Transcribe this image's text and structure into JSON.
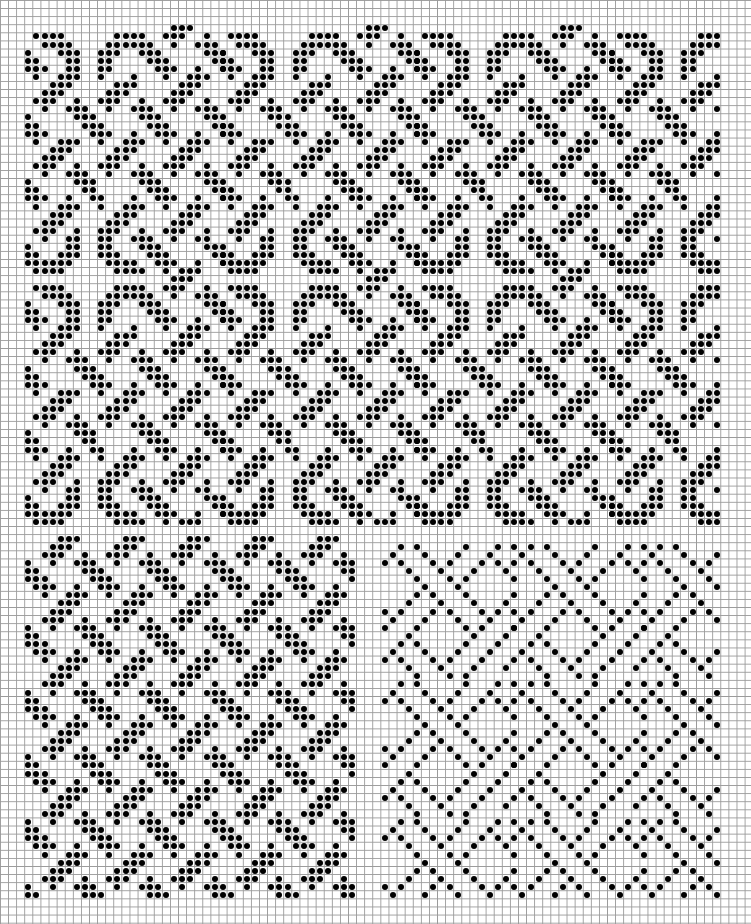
{
  "sheet": {
    "type": "dot pattern chart on grid paper",
    "cell_px": 8.1,
    "cols": 93,
    "rows": 114,
    "grid_color": "#9a9a9a",
    "dot_color": "#000000",
    "background": "#ffffff"
  },
  "panels": [
    {
      "name": "top-interlace-panel",
      "col_start": 3,
      "col_end": 88,
      "row_starts": [
        3,
        34
      ],
      "h_period": 24,
      "motif_col_origin": 3,
      "motif_rows": [
        [
          21,
          22,
          23
        ],
        [
          4,
          5,
          6,
          7,
          14,
          15,
          16,
          17,
          20,
          21,
          22,
          25
        ],
        [
          5,
          6,
          7,
          8,
          13,
          14,
          15,
          16,
          17,
          18,
          21,
          24,
          25,
          26
        ],
        [
          3,
          7,
          8,
          9,
          12,
          13,
          14,
          17,
          18,
          19,
          25,
          26,
          27
        ],
        [
          3,
          4,
          8,
          9,
          12,
          13,
          18,
          19,
          20,
          26,
          27
        ],
        [
          3,
          4,
          5,
          8,
          9,
          12,
          13,
          19,
          20,
          21,
          24,
          27
        ],
        [
          4,
          7,
          8,
          9,
          12,
          16,
          20,
          23,
          24,
          25
        ],
        [
          6,
          7,
          8,
          14,
          15,
          16,
          22,
          23,
          24
        ],
        [
          5,
          6,
          7,
          13,
          14,
          15,
          21,
          22,
          23
        ],
        [
          4,
          5,
          6,
          9,
          12,
          13,
          14,
          17,
          20,
          21,
          22,
          25
        ],
        [
          5,
          8,
          9,
          10,
          13,
          16,
          17,
          18,
          21,
          24,
          25,
          26
        ],
        [
          3,
          9,
          10,
          11,
          17,
          18,
          19,
          25,
          26
        ],
        [
          3,
          4,
          10,
          11,
          12,
          18,
          19,
          20,
          26,
          27
        ],
        [
          3,
          4,
          5,
          11,
          12,
          13,
          16,
          19,
          20,
          21,
          24,
          27
        ],
        [
          4,
          7,
          8,
          9,
          12,
          15,
          16,
          17,
          20,
          23,
          24,
          25
        ],
        [
          6,
          7,
          8,
          14,
          15,
          16,
          22,
          23,
          24
        ],
        [
          5,
          6,
          7,
          13,
          14,
          15,
          21,
          22,
          23
        ],
        [
          4,
          5,
          6,
          9,
          12,
          13,
          14,
          17,
          20,
          21,
          22,
          25
        ],
        [
          5,
          8,
          9,
          10,
          13,
          16,
          17,
          18,
          21,
          24,
          25,
          26
        ],
        [
          3,
          9,
          10,
          11,
          17,
          18,
          19,
          25,
          26
        ],
        [
          3,
          4,
          10,
          11,
          18,
          19,
          20,
          26,
          27
        ],
        [
          3,
          4,
          5,
          8,
          11,
          12,
          16,
          19,
          20,
          21,
          24,
          27
        ],
        [
          4,
          7,
          8,
          9,
          12,
          15,
          16,
          17,
          20,
          23,
          24,
          25
        ],
        [
          6,
          7,
          8,
          14,
          15,
          16,
          22,
          23,
          24
        ],
        [
          5,
          6,
          7,
          13,
          14,
          15,
          21,
          22,
          23
        ],
        [
          4,
          5,
          6,
          9,
          12,
          13,
          14,
          17,
          20,
          21,
          22,
          25
        ],
        [
          5,
          8,
          9,
          12,
          13,
          16,
          17,
          18,
          21,
          24,
          25
        ],
        [
          3,
          8,
          9,
          12,
          13,
          17,
          18,
          19,
          25,
          26
        ],
        [
          3,
          4,
          7,
          8,
          9,
          12,
          13,
          14,
          18,
          19,
          20,
          26,
          27
        ],
        [
          3,
          4,
          5,
          6,
          7,
          8,
          13,
          14,
          15,
          16,
          19,
          20,
          21,
          24,
          27
        ],
        [
          4,
          5,
          6,
          7,
          14,
          15,
          16,
          17,
          20,
          22,
          23,
          24
        ]
      ]
    },
    {
      "name": "bottom-left-interlace-panel",
      "col_start": 3,
      "col_end": 43,
      "row_start": 66,
      "row_end": 110,
      "h_period": 8,
      "v_period": 8,
      "motif_col_origin": 3,
      "motif_row_origin": 69,
      "motif_rows": [
        [
          0,
          3,
          6,
          7
        ],
        [
          0,
          1,
          7
        ],
        [
          0,
          1,
          2
        ],
        [
          1,
          2,
          3,
          6
        ],
        [
          2,
          5,
          6,
          7
        ],
        [
          4,
          5,
          6
        ],
        [
          3,
          4,
          5
        ],
        [
          2,
          3,
          4,
          7
        ]
      ]
    },
    {
      "name": "bottom-right-lattice-panel",
      "col_start": 47,
      "col_end": 88,
      "row_start": 67,
      "row_end": 110,
      "h_period": 16,
      "v_period": 17,
      "motif_col_origin": 47,
      "motif_row_origin": 67,
      "motif_rows": [
        [
          49,
          51,
          57,
          61,
          63
        ],
        [
          48,
          52,
          56,
          60
        ],
        [
          47,
          49,
          53,
          55,
          59,
          61
        ],
        [
          50,
          54,
          58,
          62
        ],
        [
          51,
          55,
          57,
          63
        ],
        [
          52,
          56
        ],
        [
          51,
          53,
          57,
          63
        ],
        [
          50,
          54,
          58,
          62
        ],
        [
          47,
          49,
          53,
          55,
          59,
          61
        ],
        [
          48,
          52,
          56,
          60
        ],
        [
          47,
          51,
          57,
          59,
          63
        ],
        [
          50,
          58,
          62
        ],
        [
          49,
          51,
          57,
          61
        ],
        [
          48,
          52,
          56,
          60
        ],
        [
          47,
          49,
          53,
          55,
          59
        ],
        [
          50,
          54,
          58,
          62
        ],
        [
          51,
          55,
          57
        ]
      ]
    }
  ]
}
